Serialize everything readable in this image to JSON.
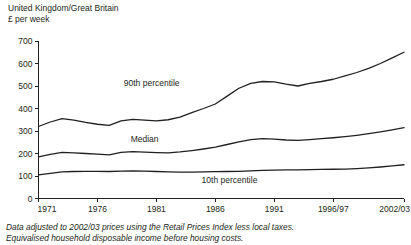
{
  "header": {
    "title": "United Kingdom/Great Britain",
    "subtitle": "£ per week"
  },
  "footnotes": {
    "line1": "Data adjusted to 2002/03 prices using the Retail Prices Index less local taxes.",
    "line2": "Equivalised household disposable income before housing costs."
  },
  "colors": {
    "line": "#231f20",
    "axis": "#231f20",
    "background": "#ffffff"
  },
  "chart_data": {
    "type": "line",
    "title": "United Kingdom/Great Britain",
    "subtitle": "£ per week",
    "xlabel": "",
    "ylabel": "£ per week",
    "ylim": [
      0,
      700
    ],
    "ytick_labels": [
      "0",
      "100",
      "200",
      "300",
      "400",
      "500",
      "600",
      "700"
    ],
    "yticks": [
      0,
      100,
      200,
      300,
      400,
      500,
      600,
      700
    ],
    "xtick_labels": [
      "1971",
      "1976",
      "1981",
      "1986",
      "1991",
      "1996/97",
      "2002/03"
    ],
    "xticks": [
      1971,
      1976,
      1981,
      1986,
      1991,
      1996,
      2002
    ],
    "xlim": [
      1971,
      2002
    ],
    "grid": false,
    "legend": "inline-labels",
    "x": [
      1971,
      1972,
      1973,
      1974,
      1975,
      1976,
      1977,
      1978,
      1979,
      1980,
      1981,
      1982,
      1983,
      1984,
      1985,
      1986,
      1987,
      1988,
      1989,
      1990,
      1991,
      1992,
      1993,
      1994,
      1995,
      1996,
      1997,
      1998,
      1999,
      2000,
      2001,
      2002
    ],
    "series": [
      {
        "name": "90th percentile",
        "label": "90th percentile",
        "label_x": 1980.6,
        "label_y": 500,
        "values": [
          320,
          340,
          355,
          348,
          338,
          330,
          325,
          345,
          352,
          348,
          345,
          350,
          362,
          382,
          400,
          420,
          455,
          490,
          512,
          520,
          518,
          508,
          500,
          512,
          520,
          530,
          545,
          560,
          578,
          600,
          625,
          650
        ]
      },
      {
        "name": "Median",
        "label": "Median",
        "label_x": 1980.0,
        "label_y": 250,
        "values": [
          185,
          196,
          205,
          203,
          200,
          197,
          194,
          205,
          208,
          206,
          204,
          203,
          207,
          213,
          220,
          228,
          240,
          252,
          262,
          266,
          264,
          260,
          258,
          262,
          266,
          270,
          275,
          281,
          288,
          296,
          305,
          315
        ]
      },
      {
        "name": "10th percentile",
        "label": "10th percentile",
        "label_x": 1987.2,
        "label_y": 68,
        "values": [
          105,
          112,
          118,
          120,
          121,
          121,
          120,
          122,
          123,
          122,
          120,
          118,
          117,
          117,
          118,
          119,
          120,
          121,
          123,
          125,
          126,
          127,
          127,
          128,
          129,
          130,
          131,
          133,
          136,
          140,
          145,
          150
        ]
      }
    ]
  }
}
